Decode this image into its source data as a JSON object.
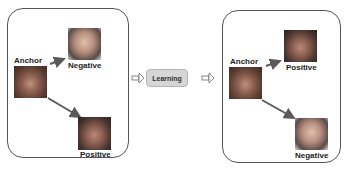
{
  "left_panel": {
    "anchor_label": "Anchor",
    "negative_label": "Negative",
    "positive_label": "Positive"
  },
  "center": {
    "learning_label": "Learning"
  },
  "right_panel": {
    "anchor_label": "Anchor",
    "positive_label": "Positive",
    "negative_label": "Negative"
  },
  "colors": {
    "arrow": "#5a5a5a",
    "box_fill": "#d6d6d6",
    "panel_border": "#555555"
  }
}
